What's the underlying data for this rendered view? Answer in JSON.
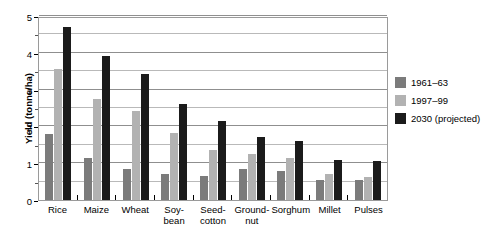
{
  "chart_data": {
    "type": "bar",
    "title": "",
    "xlabel": "",
    "ylabel": "Yield (tonne/ha)",
    "ylim": [
      0,
      5
    ],
    "yticks": [
      0,
      1,
      2,
      3,
      4,
      5
    ],
    "ytick_labels": [
      "0",
      "1",
      "2",
      "3",
      "4",
      "5"
    ],
    "minor_yticks": [
      0.5,
      1.5,
      2.5,
      3.5,
      4.5
    ],
    "grid": true,
    "legend_position": "right",
    "categories": [
      "Rice",
      "Maize",
      "Wheat",
      "Soy-bean",
      "Seed-cotton",
      "Ground-nut",
      "Sorghum",
      "Millet",
      "Pulses"
    ],
    "category_labels": [
      {
        "line1": "Rice",
        "line2": ""
      },
      {
        "line1": "Maize",
        "line2": ""
      },
      {
        "line1": "Wheat",
        "line2": ""
      },
      {
        "line1": "Soy-",
        "line2": "bean"
      },
      {
        "line1": "Seed-",
        "line2": "cotton"
      },
      {
        "line1": "Ground-",
        "line2": "nut"
      },
      {
        "line1": "Sorghum",
        "line2": ""
      },
      {
        "line1": "Millet",
        "line2": ""
      },
      {
        "line1": "Pulses",
        "line2": ""
      }
    ],
    "series": [
      {
        "name": "1961–63",
        "color": "#7b7b7b",
        "values": [
          1.8,
          1.15,
          0.83,
          0.7,
          0.65,
          0.85,
          0.8,
          0.55,
          0.55
        ]
      },
      {
        "name": "1997–99",
        "color": "#b2b2b2",
        "values": [
          3.55,
          2.75,
          2.43,
          1.82,
          1.35,
          1.25,
          1.15,
          0.7,
          0.62
        ]
      },
      {
        "name": "2030 (projected)",
        "color": "#1b1b1b",
        "values": [
          4.7,
          3.92,
          3.42,
          2.6,
          2.15,
          1.7,
          1.6,
          1.1,
          1.05
        ]
      }
    ]
  }
}
